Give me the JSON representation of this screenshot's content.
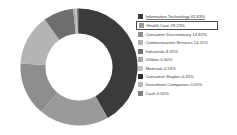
{
  "chart_data": {
    "type": "pie",
    "variant": "donut",
    "title": "",
    "subtitle": "",
    "xlabel": "",
    "ylabel": "",
    "grid": false,
    "legend_position": "right",
    "units": "percent",
    "total": "100.00%",
    "inner_radius_ratio": 0.56,
    "start_angle_deg": 0,
    "direction": "clockwise",
    "categories": [
      "Information Technology",
      "Health Care",
      "Consumer Discretionary",
      "Communication Services",
      "Industrials",
      "Utilities",
      "Materials",
      "Consumer Staples",
      "Investment Companies",
      "Cash"
    ],
    "values": [
      41.83,
      19.23,
      14.81,
      14.11,
      8.35,
      0.6,
      0.53,
      0.41,
      0.05,
      0.0
    ],
    "value_labels": [
      "41.83%",
      "19.23%",
      "14.81%",
      "14.11%",
      "8.35%",
      "0.60%",
      "0.53%",
      "0.41%",
      "0.05%",
      "0.00%"
    ],
    "colors": [
      "#3b3b3b",
      "#9a9a9a",
      "#8e8e8e",
      "#b4b4b4",
      "#6e6e6e",
      "#a8a8a8",
      "#c2c2c2",
      "#2f2f2f",
      "#b9b9b9",
      "#7f7f7f"
    ]
  },
  "legend": {
    "items": [
      {
        "label": "Information Technology",
        "value": "41.83%",
        "color": "#3b3b3b"
      },
      {
        "label": "Health Care",
        "value": "19.23%",
        "color": "#9a9a9a"
      },
      {
        "label": "Consumer Discretionary",
        "value": "14.81%",
        "color": "#8e8e8e"
      },
      {
        "label": "Communication Services",
        "value": "14.11%",
        "color": "#b4b4b4"
      },
      {
        "label": "Industrials",
        "value": "8.35%",
        "color": "#6e6e6e"
      },
      {
        "label": "Utilities",
        "value": "0.60%",
        "color": "#a8a8a8"
      },
      {
        "label": "Materials",
        "value": "0.53%",
        "color": "#c2c2c2"
      },
      {
        "label": "Consumer Staples",
        "value": "0.41%",
        "color": "#2f2f2f"
      },
      {
        "label": "Investment Companies",
        "value": "0.05%",
        "color": "#b9b9b9"
      },
      {
        "label": "Cash",
        "value": "0.00%",
        "color": "#7f7f7f"
      }
    ],
    "highlight_index": 1,
    "underline_index": 0,
    "highlight_border_color": "#4a4a4a"
  },
  "theme": {
    "background": "#ffffff",
    "text_color": "#3d3d3d",
    "accent": "#4a4a4a"
  }
}
